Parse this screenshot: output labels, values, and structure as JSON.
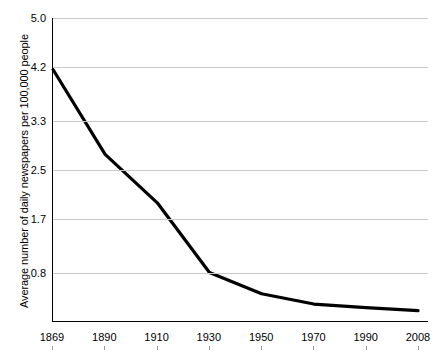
{
  "chart_data": {
    "type": "line",
    "title": "",
    "xlabel": "",
    "ylabel": "Average number of daily newspapers per 100,000 people",
    "categories": [
      "1869",
      "1890",
      "1910",
      "1930",
      "1950",
      "1970",
      "1990",
      "2008"
    ],
    "x": [
      1869,
      1890,
      1910,
      1930,
      1950,
      1970,
      1990,
      2008
    ],
    "values": [
      4.15,
      2.75,
      1.95,
      0.8,
      0.45,
      0.28,
      0.22,
      0.17
    ],
    "ytick_labels": [
      "5.0",
      "4.2",
      "3.3",
      "2.5",
      "1.7",
      "0.8"
    ],
    "ytick_values": [
      5.0,
      4.2,
      3.3,
      2.5,
      1.7,
      0.8
    ],
    "ylim": [
      0,
      5.0
    ],
    "xlim": [
      1869,
      2008
    ],
    "grid": "horizontal",
    "legend": "none",
    "series": [
      {
        "name": "Average number of daily newspapers per 100,000 people",
        "color": "#000000",
        "values": [
          4.15,
          2.75,
          1.95,
          0.8,
          0.45,
          0.28,
          0.22,
          0.17
        ]
      }
    ],
    "colors": {
      "line": "#000000",
      "grid": "#c9c9c9",
      "axis": "#000000",
      "background": "#ffffff",
      "text": "#000000"
    }
  }
}
